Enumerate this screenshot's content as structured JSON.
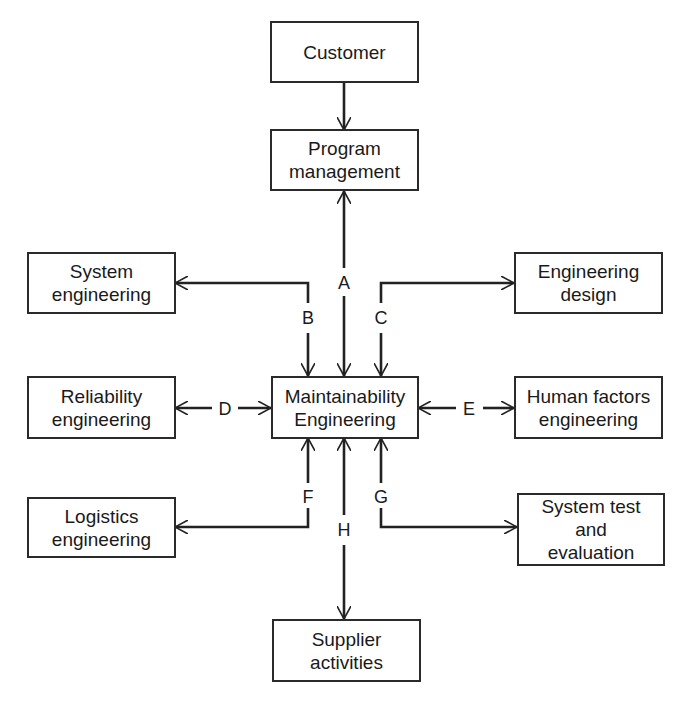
{
  "diagram": {
    "nodes": {
      "customer": {
        "label": "Customer"
      },
      "program_management": {
        "label": "Program\nmanagement"
      },
      "system_engineering": {
        "label": "System\nengineering"
      },
      "engineering_design": {
        "label": "Engineering\ndesign"
      },
      "maintainability_engineering": {
        "label": "Maintainability\nEngineering"
      },
      "reliability_engineering": {
        "label": "Reliability\nengineering"
      },
      "human_factors_engineering": {
        "label": "Human factors\nengineering"
      },
      "logistics_engineering": {
        "label": "Logistics\nengineering"
      },
      "system_test_evaluation": {
        "label": "System test\nand\nevaluation"
      },
      "supplier_activities": {
        "label": "Supplier\nactivities"
      }
    },
    "edges": {
      "a": {
        "label": "A"
      },
      "b": {
        "label": "B"
      },
      "c": {
        "label": "C"
      },
      "d": {
        "label": "D"
      },
      "e": {
        "label": "E"
      },
      "f": {
        "label": "F"
      },
      "g": {
        "label": "G"
      },
      "h": {
        "label": "H"
      }
    }
  }
}
